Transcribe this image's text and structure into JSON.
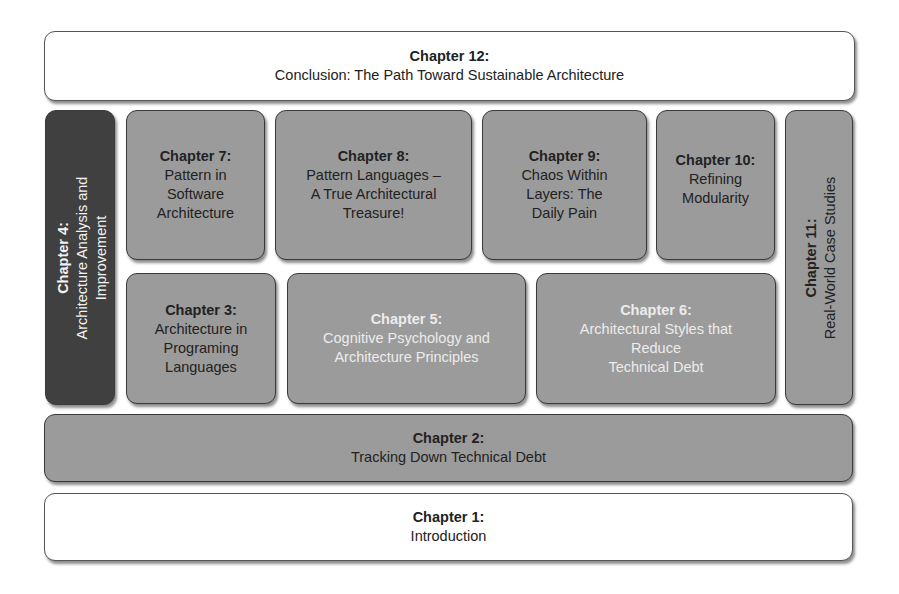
{
  "diagram": {
    "type": "layered book chapter map",
    "colors": {
      "white_box": "#ffffff",
      "gray_box": "#9b9b9b",
      "dark_box": "#404040",
      "light_text": "#ececec",
      "dark_text": "#222222"
    },
    "chapters": {
      "ch12": {
        "title": "Chapter 12:",
        "subtitle": "Conclusion: The Path Toward Sustainable Architecture"
      },
      "ch4": {
        "title": "Chapter 4:",
        "line1": "Architecture Analysis and",
        "line2": "Improvement"
      },
      "ch7": {
        "title": "Chapter 7:",
        "line1": "Pattern in",
        "line2": "Software",
        "line3": "Architecture"
      },
      "ch8": {
        "title": "Chapter 8:",
        "line1": "Pattern Languages –",
        "line2": "A True Architectural",
        "line3": "Treasure!"
      },
      "ch9": {
        "title": "Chapter 9:",
        "line1": "Chaos Within",
        "line2": "Layers: The",
        "line3": "Daily Pain"
      },
      "ch10": {
        "title": "Chapter 10:",
        "line1": "Refining",
        "line2": "Modularity"
      },
      "ch11": {
        "title": "Chapter 11:",
        "line1": "Real-World Case Studies"
      },
      "ch3": {
        "title": "Chapter 3:",
        "line1": "Architecture in",
        "line2": "Programing",
        "line3": "Languages"
      },
      "ch5": {
        "title": "Chapter 5:",
        "line1": "Cognitive Psychology and",
        "line2": "Architecture Principles"
      },
      "ch6": {
        "title": "Chapter 6:",
        "line1": "Architectural Styles that",
        "line2": "Reduce",
        "line3": "Technical Debt"
      },
      "ch2": {
        "title": "Chapter 2:",
        "subtitle": "Tracking Down Technical Debt"
      },
      "ch1": {
        "title": "Chapter 1:",
        "subtitle": "Introduction"
      }
    }
  }
}
